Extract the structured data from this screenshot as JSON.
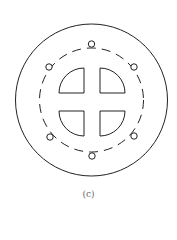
{
  "figure": {
    "caption": "(c)",
    "stroke_color": "#222222",
    "outer_circle": {
      "cx": 91.5,
      "cy": 100,
      "r": 76
    },
    "dashed_circle": {
      "cx": 91.5,
      "cy": 100,
      "r": 52,
      "dash": "9 6"
    },
    "bolt_holes": [
      {
        "cx": 91.5,
        "cy": 44
      },
      {
        "cx": 49,
        "cy": 67
      },
      {
        "cx": 134,
        "cy": 67
      },
      {
        "cx": 50,
        "cy": 137
      },
      {
        "cx": 134,
        "cy": 136
      },
      {
        "cx": 92,
        "cy": 156
      }
    ],
    "bolt_hole_radius": 3.2,
    "quadrant_windows": [
      {
        "name": "top-left",
        "d": "M84,68 L84,93 L59,93 A25,25 0 0 1 84,68 Z"
      },
      {
        "name": "top-right",
        "d": "M100,68 L100,93 L125,93 A25,25 0 0 0 100,68 Z"
      },
      {
        "name": "bottom-left",
        "d": "M84,136 L84,111 L59,111 A25,25 0 0 0 84,136 Z"
      },
      {
        "name": "bottom-right",
        "d": "M100,136 L100,111 L125,111 A25,25 0 0 1 100,136 Z"
      }
    ]
  }
}
